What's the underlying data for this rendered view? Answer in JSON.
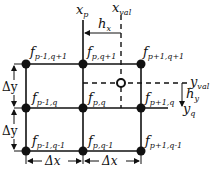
{
  "diagram": {
    "axis_labels": {
      "x_p": {
        "main": "x",
        "sub": "p"
      },
      "x_val": {
        "main": "x",
        "sub": "val"
      },
      "y_val": {
        "main": "y",
        "sub": "val"
      },
      "y_q": {
        "main": "y",
        "sub": "q"
      }
    },
    "spacing_labels": {
      "h_x": {
        "main": "h",
        "sub": "x"
      },
      "h_y": {
        "main": "h",
        "sub": "y"
      },
      "dx": "Δx",
      "dy": "Δy"
    },
    "nodes": [
      {
        "main": "f",
        "sub": "p-1,q+1"
      },
      {
        "main": "f",
        "sub": "p,q+1"
      },
      {
        "main": "f",
        "sub": "p+1,q+1"
      },
      {
        "main": "f",
        "sub": "p-1,q"
      },
      {
        "main": "f",
        "sub": "p,q"
      },
      {
        "main": "f",
        "sub": "p+1,q"
      },
      {
        "main": "f",
        "sub": "p-1,q-1"
      },
      {
        "main": "f",
        "sub": "p,q-1"
      },
      {
        "main": "f",
        "sub": "p+1,q-1"
      }
    ],
    "colors": {
      "line": "#111111",
      "background": "#ffffff"
    }
  }
}
